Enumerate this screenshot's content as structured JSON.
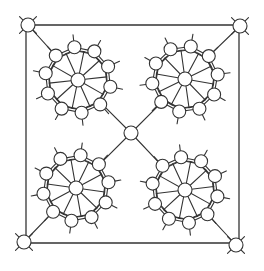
{
  "diagram": {
    "type": "molecular-structure",
    "stroke_color": "#333333",
    "node_fill": "#ffffff",
    "frame": {
      "x1": 26,
      "y1": 25,
      "x2": 239,
      "y2": 243
    },
    "corner_nodes": [
      {
        "id": "corner-top-left",
        "x": 28,
        "y": 25
      },
      {
        "id": "corner-top-right",
        "x": 240,
        "y": 26
      },
      {
        "id": "corner-bottom-left",
        "x": 24,
        "y": 242
      },
      {
        "id": "corner-bottom-right",
        "x": 236,
        "y": 245
      }
    ],
    "center_node": {
      "id": "center",
      "x": 131,
      "y": 133
    },
    "clusters": [
      {
        "id": "cluster-top-left",
        "cx": 78,
        "cy": 80
      },
      {
        "id": "cluster-top-right",
        "cx": 185,
        "cy": 79
      },
      {
        "id": "cluster-bottom-left",
        "cx": 76,
        "cy": 188
      },
      {
        "id": "cluster-bottom-right",
        "cx": 185,
        "cy": 190
      }
    ],
    "cluster_outer_nodes": 10,
    "cluster_outer_radius": 33,
    "cluster_inner_radius": 29,
    "node_radius": 6.5,
    "corner_node_radius": 7
  }
}
